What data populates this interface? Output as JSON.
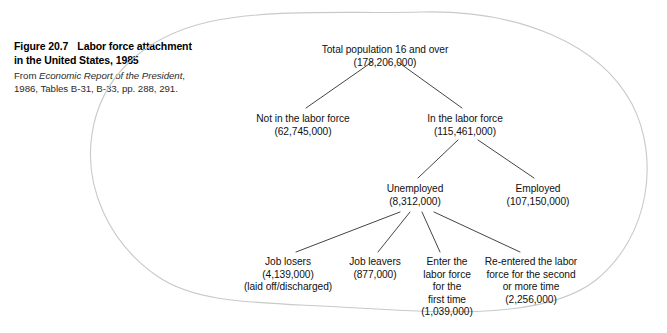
{
  "caption": {
    "figure_number": "Figure 20.7",
    "title": "Labor force attachment in the United States, 1985",
    "title_line1": "Labor force attachment",
    "title_line2": "in the United States, 1985",
    "source_prefix": "From ",
    "source_italic": "Economic Report of the President",
    "source_suffix": ",",
    "source_line2": "1986, Tables B-31, B-33, pp. 288, 291."
  },
  "diagram": {
    "type": "tree",
    "outline_shape": "hand-drawn-blob",
    "outline_color": "#c9c9c9",
    "line_color": "#3a3a3a",
    "text_color": "#111111",
    "nodes": {
      "total_population": {
        "label": "Total population 16 and over",
        "value": "(178,206,000)",
        "number": 178206000
      },
      "not_in_labor_force": {
        "label": "Not in the labor force",
        "value": "(62,745,000)",
        "number": 62745000
      },
      "in_labor_force": {
        "label": "In the labor force",
        "value": "(115,461,000)",
        "number": 115461000
      },
      "unemployed": {
        "label": "Unemployed",
        "value": "(8,312,000)",
        "number": 8312000
      },
      "employed": {
        "label": "Employed",
        "value": "(107,150,000)",
        "number": 107150000
      },
      "job_losers": {
        "label": "Job losers",
        "value": "(4,139,000)",
        "note": "(laid off/discharged)",
        "number": 4139000
      },
      "job_leavers": {
        "label": "Job leavers",
        "value": "(877,000)",
        "number": 877000
      },
      "new_entrants": {
        "label_line1": "Enter the",
        "label_line2": "labor force",
        "label_line3": "for the",
        "label_line4": "first time",
        "value": "(1,039,000)",
        "number": 1039000
      },
      "reentrants": {
        "label_line1": "Re-entered the labor",
        "label_line2": "force for the second",
        "label_line3": "or more time",
        "value": "(2,256,000)",
        "number": 2256000
      }
    }
  }
}
